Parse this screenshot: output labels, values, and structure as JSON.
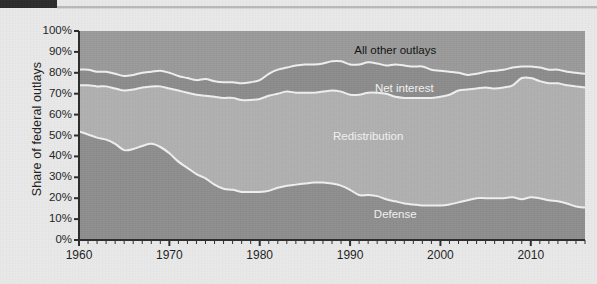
{
  "figure": {
    "ylabel": "Share of federal outlays",
    "ytick_labels": [
      "100%",
      "90%",
      "80%",
      "70%",
      "60%",
      "50%",
      "40%",
      "30%",
      "20%",
      "10%",
      "0%"
    ],
    "xtick_labels": [
      "1960",
      "1970",
      "1980",
      "1990",
      "2000",
      "2010"
    ],
    "series_labels": {
      "all_other": "All other outlays",
      "net_interest": "Net interest",
      "redistribution": "Redistribution",
      "defense": "Defense"
    },
    "colors": {
      "background": "#e9e9e9",
      "all_other": "#9a9a9a",
      "net_interest": "#8c8c8c",
      "redistribution": "#b0b0b0",
      "defense": "#8e8e8e",
      "separator": "#f0f0f0",
      "axis": "#2b2b2b",
      "corner_block": "#2b2b2b"
    }
  },
  "chart_data": {
    "type": "area",
    "title": "",
    "subtitle": "",
    "xlabel": "",
    "ylabel": "Share of federal outlays",
    "xlim": [
      1960,
      2016
    ],
    "ylim": [
      0,
      100
    ],
    "grid": false,
    "legend": "inline-labels",
    "stacked": true,
    "stack_order_bottom_to_top": [
      "Defense",
      "Redistribution",
      "Net interest",
      "All other outlays"
    ],
    "x": [
      1960,
      1961,
      1962,
      1963,
      1964,
      1965,
      1966,
      1967,
      1968,
      1969,
      1970,
      1971,
      1972,
      1973,
      1974,
      1975,
      1976,
      1977,
      1978,
      1979,
      1980,
      1981,
      1982,
      1983,
      1984,
      1985,
      1986,
      1987,
      1988,
      1989,
      1990,
      1991,
      1992,
      1993,
      1994,
      1995,
      1996,
      1997,
      1998,
      1999,
      2000,
      2001,
      2002,
      2003,
      2004,
      2005,
      2006,
      2007,
      2008,
      2009,
      2010,
      2011,
      2012,
      2013,
      2014,
      2015,
      2016
    ],
    "series": [
      {
        "name": "Defense",
        "color": "#8e8e8e",
        "values": [
          52.0,
          50.5,
          49.0,
          48.0,
          46.0,
          43.0,
          43.5,
          45.0,
          46.0,
          44.5,
          41.5,
          37.5,
          34.5,
          31.5,
          29.5,
          26.5,
          24.5,
          24.0,
          23.0,
          23.0,
          23.0,
          23.5,
          25.0,
          26.0,
          26.5,
          27.0,
          27.5,
          27.5,
          27.0,
          26.0,
          24.0,
          21.5,
          21.5,
          21.0,
          19.5,
          18.5,
          17.5,
          17.0,
          16.5,
          16.5,
          16.5,
          17.0,
          18.0,
          19.0,
          20.0,
          20.0,
          20.0,
          20.0,
          20.5,
          19.5,
          20.5,
          20.0,
          19.0,
          18.5,
          17.5,
          16.0,
          15.5
        ]
      },
      {
        "name": "Redistribution",
        "color": "#b0b0b0",
        "values": [
          22.0,
          23.5,
          24.5,
          25.5,
          26.5,
          28.5,
          28.5,
          28.0,
          27.5,
          29.0,
          31.0,
          34.0,
          36.0,
          38.0,
          39.5,
          42.0,
          43.5,
          44.0,
          44.0,
          44.0,
          44.5,
          45.5,
          45.0,
          45.0,
          44.0,
          43.5,
          43.0,
          43.5,
          44.5,
          45.0,
          45.5,
          48.0,
          49.0,
          49.5,
          50.5,
          50.0,
          50.5,
          51.0,
          51.5,
          51.5,
          52.0,
          52.5,
          53.5,
          53.0,
          52.5,
          53.0,
          52.5,
          53.0,
          53.5,
          58.0,
          57.0,
          56.0,
          56.0,
          56.5,
          56.5,
          57.5,
          57.5
        ]
      },
      {
        "name": "Net interest",
        "color": "#8c8c8c",
        "values": [
          7.5,
          7.5,
          7.0,
          7.0,
          7.0,
          7.0,
          7.0,
          7.0,
          7.0,
          7.5,
          7.5,
          7.0,
          7.0,
          7.0,
          8.0,
          7.5,
          7.5,
          7.5,
          8.0,
          8.5,
          9.0,
          10.5,
          11.5,
          11.5,
          13.0,
          13.5,
          13.5,
          13.5,
          14.0,
          14.5,
          14.5,
          14.5,
          14.5,
          14.0,
          13.5,
          15.5,
          15.5,
          15.0,
          15.0,
          13.5,
          12.5,
          11.0,
          8.5,
          7.0,
          7.0,
          7.5,
          8.5,
          8.5,
          8.5,
          5.5,
          5.5,
          6.5,
          6.5,
          6.5,
          6.5,
          6.5,
          6.5
        ]
      },
      {
        "name": "All other outlays",
        "color": "#9a9a9a",
        "values": [
          18.5,
          18.5,
          19.5,
          19.5,
          20.5,
          21.5,
          21.0,
          20.0,
          19.5,
          19.0,
          20.0,
          21.5,
          22.5,
          23.5,
          23.0,
          24.0,
          24.5,
          24.5,
          25.0,
          24.5,
          23.5,
          20.5,
          18.5,
          17.5,
          16.5,
          16.0,
          16.0,
          15.5,
          14.5,
          14.5,
          16.0,
          16.0,
          15.0,
          15.5,
          16.5,
          16.0,
          16.5,
          17.0,
          17.0,
          18.5,
          19.0,
          19.5,
          20.0,
          21.0,
          20.5,
          19.5,
          19.0,
          18.5,
          17.5,
          17.0,
          17.0,
          17.5,
          18.5,
          18.5,
          19.5,
          20.0,
          20.5
        ]
      }
    ]
  }
}
